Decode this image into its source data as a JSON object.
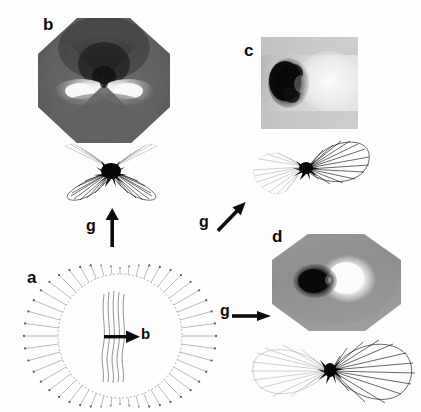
{
  "figure": {
    "type": "scientific-micrograph-figure",
    "background_color": "#ffffff",
    "ink_color": "#0b0b0b"
  },
  "panels": {
    "a": {
      "label": "a",
      "kind": "schematic-diagram",
      "description": "Circular dislocation loop drawn as a dotted circle with radial spokes terminating in dots; central group of near-vertical dislocation lines with a bold arrow labelled b.",
      "burgers_vector_label": "b",
      "spoke_count": 48,
      "center_line_count": 5
    },
    "b": {
      "label": "b",
      "kind": "micrograph",
      "shape": "octagon",
      "contrast": "dark bow-tie above centre, bright bow-tie below centre on mid-grey octagonal field",
      "base_gray": "#5a5a5a"
    },
    "c": {
      "label": "c",
      "kind": "micrograph",
      "shape": "square",
      "contrast": "large black lobe at left, bright white region at right on light grey field",
      "base_gray": "#cfcfcf"
    },
    "d": {
      "label": "d",
      "kind": "micrograph",
      "shape": "octagon",
      "contrast": "black lobe left of centre, intense white lobe right of centre on mid-grey octagonal field",
      "base_gray": "#8d8d8d"
    }
  },
  "lobe_diagrams": {
    "b": {
      "for_panel": "b",
      "description": "Butterfly pattern: two strong dark lobes pointing down-left and down-right from a black central node, with faint radiating strokes pointing up-left and up-right.",
      "strong_lobe_directions_deg": [
        205,
        335
      ],
      "faint_lobe_directions_deg": [
        25,
        155
      ],
      "lobe_line_count": 9
    },
    "c": {
      "for_panel": "c",
      "description": "Single strong dark lobe extending to the upper right from a black node, with faint radiating strokes to the lower left.",
      "strong_lobe_direction_deg": 20,
      "faint_lobe_direction_deg": 200,
      "lobe_line_count": 11
    },
    "d": {
      "for_panel": "d",
      "description": "Horizontal two-lobe pattern: large strong dark lobe to the right of a black node and a faint mirrored lobe to the left.",
      "strong_lobe_direction_deg": 0,
      "faint_lobe_direction_deg": 180,
      "lobe_line_count": 13
    }
  },
  "arrows": [
    {
      "id": "g-up",
      "label": "g",
      "direction": "up",
      "angle_deg": 90,
      "points_to_panel": "b"
    },
    {
      "id": "g-diagonal",
      "label": "g",
      "direction": "up-right",
      "angle_deg": 45,
      "points_to_panel": "c"
    },
    {
      "id": "g-right",
      "label": "g",
      "direction": "right",
      "angle_deg": 0,
      "points_to_panel": "d"
    },
    {
      "id": "b-right",
      "label": "b",
      "direction": "right",
      "angle_deg": 0,
      "points_to_panel": "a"
    }
  ]
}
